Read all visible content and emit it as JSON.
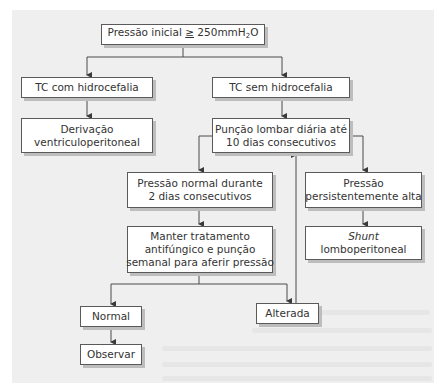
{
  "diagram": {
    "type": "flowchart",
    "language": "pt-BR",
    "nodes": {
      "start": {
        "prefix": "Pressão inicial ",
        "operator": "≥",
        "value": " 250mmH",
        "subscript": "2",
        "suffix": "O"
      },
      "tc_com": {
        "line1": "TC com hidrocefalia"
      },
      "derivacao": {
        "line1": "Derivação",
        "line2": "ventriculoperitoneal"
      },
      "tc_sem": {
        "line1": "TC sem hidrocefalia"
      },
      "puncao": {
        "line1": "Punção lombar diária até",
        "line2": "10 dias consecutivos"
      },
      "pressao_normal": {
        "line1": "Pressão normal durante",
        "line2": "2 dias consecutivos"
      },
      "pressao_alta": {
        "line1": "Pressão",
        "line2": "persistentemente alta"
      },
      "manter": {
        "line1": "Manter tratamento",
        "line2": "antifúngico e punção",
        "line3": "semanal para aferir pressão"
      },
      "shunt": {
        "line1_italic": "Shunt",
        "line2": "lomboperitoneal"
      },
      "normal": {
        "line1": "Normal"
      },
      "alterada": {
        "line1": "Alterada"
      },
      "observar": {
        "line1": "Observar"
      }
    },
    "edges": [
      {
        "from": "start",
        "to": "tc_com"
      },
      {
        "from": "start",
        "to": "tc_sem"
      },
      {
        "from": "tc_com",
        "to": "derivacao"
      },
      {
        "from": "tc_sem",
        "to": "puncao"
      },
      {
        "from": "puncao",
        "to": "pressao_normal"
      },
      {
        "from": "puncao",
        "to": "pressao_alta"
      },
      {
        "from": "pressao_normal",
        "to": "manter"
      },
      {
        "from": "pressao_alta",
        "to": "shunt"
      },
      {
        "from": "manter",
        "to": "normal"
      },
      {
        "from": "manter",
        "to": "alterada"
      },
      {
        "from": "normal",
        "to": "observar"
      },
      {
        "from": "alterada",
        "to": "puncao"
      }
    ],
    "colors": {
      "panel_background": "#efefef",
      "box_fill": "#ffffff",
      "box_border": "#5a5a5a",
      "box_shadow": "#bdbdbd",
      "line": "#4a4a4a",
      "text": "#333333"
    }
  }
}
